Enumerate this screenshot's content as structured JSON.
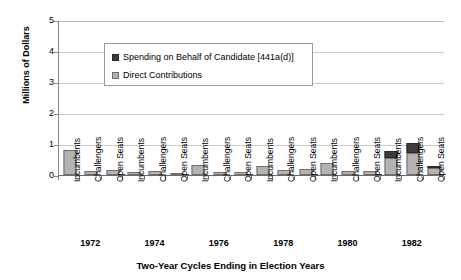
{
  "chart_data": {
    "type": "bar",
    "stacked": true,
    "title": "",
    "xlabel": "Two-Year Cycles Ending in Election Years",
    "ylabel": "Millions of Dollars",
    "ylim": [
      0,
      5
    ],
    "yticks": [
      0,
      1,
      2,
      3,
      4,
      5
    ],
    "grid": true,
    "legend_position": "upper-left-inside",
    "groups": [
      "1972",
      "1974",
      "1976",
      "1978",
      "1980",
      "1982"
    ],
    "categories": [
      "Incumbents",
      "Challengers",
      "Open Seats",
      "Incumbents",
      "Challengers",
      "Open Seats",
      "Incumbents",
      "Challengers",
      "Open Seats",
      "Incumbents",
      "Challengers",
      "Open Seats",
      "Incumbents",
      "Challengers",
      "Open Seats",
      "Incumbents",
      "Challengers",
      "Open Seats"
    ],
    "series": [
      {
        "name": "Direct Contributions",
        "color": "#b3b3b3",
        "values": [
          0.8,
          0.12,
          0.17,
          0.1,
          0.12,
          0.08,
          0.33,
          0.11,
          0.1,
          0.28,
          0.16,
          0.2,
          0.38,
          0.12,
          0.14,
          0.55,
          0.72,
          0.22
        ]
      },
      {
        "name": "Spending on Behalf of Candidate [441a(d)]",
        "color": "#3b3b3b",
        "values": [
          0.0,
          0.0,
          0.0,
          0.0,
          0.0,
          0.0,
          0.0,
          0.0,
          0.0,
          0.0,
          0.0,
          0.0,
          0.0,
          0.0,
          0.0,
          0.22,
          0.32,
          0.08
        ]
      }
    ]
  },
  "legend": {
    "items": [
      {
        "label": "Spending on Behalf of Candidate [441a(d)]",
        "swatch": "dark-gray-swatch"
      },
      {
        "label": "Direct Contributions",
        "swatch": "light-gray-swatch"
      }
    ]
  },
  "axes": {
    "y_title": "Millions of Dollars",
    "y_tick_labels": [
      "5",
      "4",
      "3",
      "2",
      "1",
      "0"
    ],
    "x_title": "Two-Year Cycles Ending in Election Years",
    "year_labels": [
      "1972",
      "1974",
      "1976",
      "1978",
      "1980",
      "1982"
    ]
  }
}
